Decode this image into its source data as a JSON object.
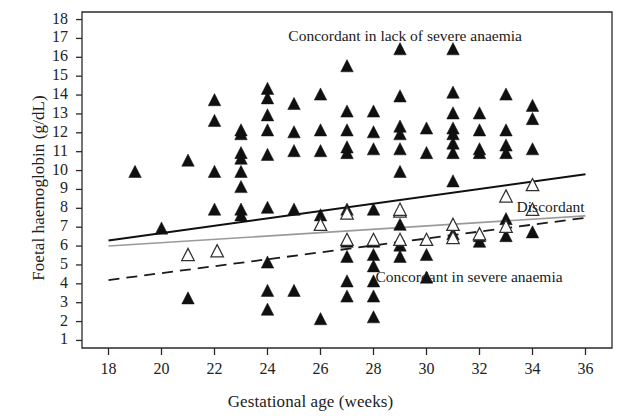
{
  "chart_data": {
    "type": "scatter",
    "title": "",
    "xlabel": "Gestational age (weeks)",
    "ylabel": "Foetal haemoglobin (g/dL)",
    "xlim": [
      17.0,
      37.0
    ],
    "ylim": [
      0.6,
      18.4
    ],
    "xticks": [
      18,
      20,
      22,
      24,
      26,
      28,
      30,
      32,
      34,
      36
    ],
    "yticks": [
      1,
      2,
      3,
      4,
      5,
      6,
      7,
      8,
      9,
      10,
      11,
      12,
      13,
      14,
      15,
      16,
      17,
      18
    ],
    "grid": false,
    "legend_position": "in-plot annotations",
    "annotations": [
      {
        "text": "Concordant in lack of severe anaemia",
        "x": 29.2,
        "y": 17.1
      },
      {
        "text": "Discordant",
        "x": 33.4,
        "y": 8.0
      },
      {
        "text": "Concordant in severe anaemia",
        "x": 31.6,
        "y": 4.3
      }
    ],
    "series": [
      {
        "name": "Concordant in lack of severe anaemia",
        "marker": "filled-triangle",
        "color": "#101010",
        "points": [
          [
            19.0,
            9.9
          ],
          [
            20.0,
            6.9
          ],
          [
            21.0,
            10.5
          ],
          [
            21.0,
            3.2
          ],
          [
            22.0,
            13.7
          ],
          [
            22.0,
            12.6
          ],
          [
            22.0,
            9.9
          ],
          [
            22.0,
            7.9
          ],
          [
            23.0,
            12.1
          ],
          [
            23.0,
            11.9
          ],
          [
            23.0,
            10.9
          ],
          [
            23.0,
            10.6
          ],
          [
            23.0,
            9.9
          ],
          [
            23.0,
            9.1
          ],
          [
            23.0,
            7.9
          ],
          [
            23.0,
            7.6
          ],
          [
            24.0,
            14.3
          ],
          [
            24.0,
            13.8
          ],
          [
            24.0,
            12.9
          ],
          [
            24.0,
            12.1
          ],
          [
            24.0,
            10.8
          ],
          [
            24.0,
            8.0
          ],
          [
            24.0,
            5.1
          ],
          [
            24.0,
            3.6
          ],
          [
            24.0,
            2.6
          ],
          [
            25.0,
            13.5
          ],
          [
            25.0,
            12.0
          ],
          [
            25.0,
            11.0
          ],
          [
            25.0,
            7.9
          ],
          [
            25.0,
            3.6
          ],
          [
            26.0,
            14.0
          ],
          [
            26.0,
            12.1
          ],
          [
            26.0,
            11.0
          ],
          [
            26.0,
            7.6
          ],
          [
            26.0,
            2.1
          ],
          [
            27.0,
            15.5
          ],
          [
            27.0,
            13.1
          ],
          [
            27.0,
            12.1
          ],
          [
            27.0,
            11.2
          ],
          [
            27.0,
            10.9
          ],
          [
            27.0,
            7.9
          ],
          [
            27.0,
            6.2
          ],
          [
            27.0,
            5.4
          ],
          [
            27.0,
            4.1
          ],
          [
            27.0,
            3.3
          ],
          [
            28.0,
            13.1
          ],
          [
            28.0,
            12.0
          ],
          [
            28.0,
            11.1
          ],
          [
            28.0,
            7.9
          ],
          [
            28.0,
            6.2
          ],
          [
            28.0,
            5.5
          ],
          [
            28.0,
            4.9
          ],
          [
            28.0,
            4.1
          ],
          [
            28.0,
            3.3
          ],
          [
            28.0,
            2.2
          ],
          [
            29.0,
            16.4
          ],
          [
            29.0,
            13.9
          ],
          [
            29.0,
            12.3
          ],
          [
            29.0,
            11.9
          ],
          [
            29.0,
            11.1
          ],
          [
            29.0,
            9.9
          ],
          [
            29.0,
            7.1
          ],
          [
            29.0,
            6.0
          ],
          [
            29.0,
            5.4
          ],
          [
            30.0,
            12.2
          ],
          [
            30.0,
            10.9
          ],
          [
            30.0,
            5.5
          ],
          [
            30.0,
            4.3
          ],
          [
            31.0,
            16.4
          ],
          [
            31.0,
            14.1
          ],
          [
            31.0,
            13.0
          ],
          [
            31.0,
            12.2
          ],
          [
            31.0,
            11.9
          ],
          [
            31.0,
            11.4
          ],
          [
            31.0,
            10.9
          ],
          [
            31.0,
            9.4
          ],
          [
            31.0,
            6.6
          ],
          [
            32.0,
            13.0
          ],
          [
            32.0,
            12.1
          ],
          [
            32.0,
            11.1
          ],
          [
            32.0,
            10.9
          ],
          [
            32.0,
            6.5
          ],
          [
            32.0,
            6.2
          ],
          [
            33.0,
            14.0
          ],
          [
            33.0,
            12.1
          ],
          [
            33.0,
            11.3
          ],
          [
            33.0,
            10.9
          ],
          [
            33.0,
            7.4
          ],
          [
            33.0,
            6.5
          ],
          [
            34.0,
            13.4
          ],
          [
            34.0,
            12.7
          ],
          [
            34.0,
            11.1
          ],
          [
            34.0,
            6.7
          ]
        ]
      },
      {
        "name": "Discordant",
        "marker": "open-triangle",
        "color": "#ffffff",
        "edge_color": "#303030",
        "points": [
          [
            21.0,
            5.5
          ],
          [
            22.1,
            5.7
          ],
          [
            26.0,
            7.1
          ],
          [
            27.0,
            6.3
          ],
          [
            27.0,
            7.7
          ],
          [
            28.0,
            6.3
          ],
          [
            29.0,
            7.8
          ],
          [
            29.0,
            6.3
          ],
          [
            29.0,
            7.9
          ],
          [
            30.0,
            6.3
          ],
          [
            31.0,
            7.1
          ],
          [
            31.0,
            6.4
          ],
          [
            32.0,
            6.6
          ],
          [
            33.0,
            8.6
          ],
          [
            33.0,
            7.0
          ],
          [
            34.0,
            9.2
          ],
          [
            34.0,
            7.9
          ]
        ]
      }
    ],
    "trend_lines": [
      {
        "name": "Concordant in lack of severe anaemia trend",
        "style": "solid",
        "color": "#101010",
        "width": 2.0,
        "x_start": 18.0,
        "y_start": 6.3,
        "x_end": 36.0,
        "y_end": 9.8
      },
      {
        "name": "Discordant trend",
        "style": "solid",
        "color": "#9a9a9a",
        "width": 1.6,
        "x_start": 18.0,
        "y_start": 6.0,
        "x_end": 36.0,
        "y_end": 7.6
      },
      {
        "name": "Concordant in severe anaemia trend",
        "style": "dashed",
        "color": "#1a1a1a",
        "width": 1.8,
        "x_start": 18.0,
        "y_start": 4.2,
        "x_end": 36.0,
        "y_end": 7.5
      }
    ]
  },
  "axes": {
    "x_title": "Gestational age (weeks)",
    "y_title": "Foetal haemoglobin (g/dL)"
  }
}
